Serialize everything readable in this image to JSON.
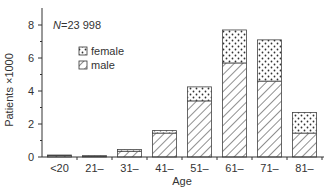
{
  "chart_data": {
    "type": "bar",
    "stacked": true,
    "title": "",
    "annotation": "N = 23 998",
    "annotation_parts": {
      "italic": "N",
      "rest": "=23 998"
    },
    "xlabel": "Age",
    "ylabel": "Patients ×1000",
    "ylim": [
      0,
      8.9
    ],
    "yticks": [
      0,
      2,
      4,
      6,
      8
    ],
    "yminor_ticks": [
      1,
      3,
      5,
      7
    ],
    "grid": false,
    "legend_position": "upper-left (inside)",
    "categories": [
      "<20",
      "21–",
      "31–",
      "41–",
      "51–",
      "61–",
      "71–",
      "81–"
    ],
    "series": [
      {
        "name": "male",
        "pattern": "hatched",
        "values": [
          0.08,
          0.05,
          0.35,
          1.45,
          3.4,
          5.7,
          4.6,
          1.45
        ]
      },
      {
        "name": "female",
        "pattern": "dotted",
        "values": [
          0.04,
          0.03,
          0.1,
          0.15,
          0.85,
          2.0,
          2.5,
          1.25
        ]
      }
    ],
    "totals": [
      0.12,
      0.08,
      0.45,
      1.6,
      4.25,
      7.7,
      7.1,
      2.7
    ]
  },
  "legend": {
    "female_label": "female",
    "male_label": "male"
  },
  "colors": {
    "stroke": "#333333",
    "fill": "#ffffff"
  }
}
